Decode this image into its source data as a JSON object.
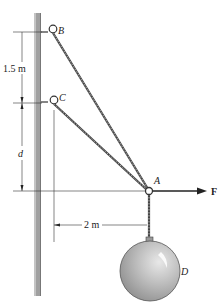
{
  "diagram": {
    "points": {
      "B": "B",
      "C": "C",
      "A": "A",
      "D": "D"
    },
    "force": "F",
    "dimensions": {
      "vertical_BC": "1.5 m",
      "vertical_CA": "d",
      "horizontal": "2 m"
    },
    "colors": {
      "wall": "#9a9a9a",
      "cable": "#555555",
      "ball": "#b0b0b0",
      "line": "#333333"
    }
  }
}
